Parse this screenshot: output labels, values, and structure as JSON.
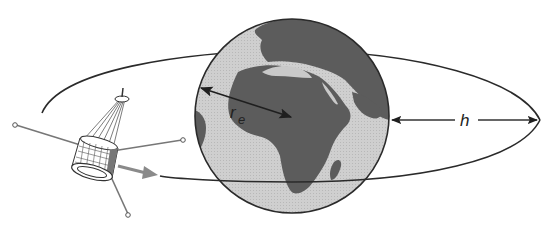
{
  "diagram": {
    "type": "satellite-orbit-illustration",
    "labels": {
      "earth_radius": "r",
      "earth_radius_subscript": "e",
      "altitude": "h"
    },
    "elements": {
      "earth": "globe-showing-africa-and-europe",
      "orbit": "elliptical-orbit-path",
      "satellite": "spin-stabilized-satellite-with-whip-antennas",
      "motion_arrow": "direction-of-travel"
    },
    "colors": {
      "ocean": "#c9c9c9",
      "land": "#5a5a5a",
      "outline": "#2a2a2a",
      "motion_arrow": "#8a8a8a",
      "background": "#ffffff"
    }
  }
}
